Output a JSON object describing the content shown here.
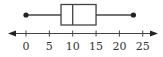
{
  "chart_data": {
    "type": "boxplot",
    "title": "",
    "xlabel": "",
    "ylabel": "",
    "orientation": "horizontal",
    "min": 0,
    "q1": 7.5,
    "median": 10,
    "q3": 15,
    "max": 23,
    "axis": {
      "range": [
        -3,
        28
      ],
      "ticks": [
        0,
        5,
        10,
        15,
        20,
        25
      ],
      "tick_labels": [
        "0",
        "5",
        "10",
        "15",
        "20",
        "25"
      ],
      "arrows": "both",
      "grid": false
    },
    "colors": {
      "stroke": "#444444",
      "dot": "#222222",
      "text": "#333333"
    }
  }
}
